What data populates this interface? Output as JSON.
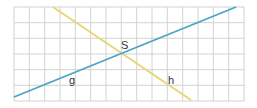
{
  "diagram": {
    "grid": {
      "x0": 14,
      "y0": 7,
      "x1": 244,
      "y1": 101,
      "cols": 15,
      "rows": 6,
      "color": "#d2d2d2"
    },
    "lines": [
      {
        "name": "g",
        "color": "#4aa3c8",
        "x1": 14,
        "y1": 97,
        "x2": 236,
        "y2": 7
      },
      {
        "name": "h",
        "color": "#e6d67a",
        "x1": 53,
        "y1": 7,
        "x2": 191,
        "y2": 100
      }
    ],
    "labels": {
      "intersection": "S",
      "line_g": "g",
      "line_h": "h"
    },
    "intersection_point": {
      "x": 123,
      "y": 53
    }
  }
}
